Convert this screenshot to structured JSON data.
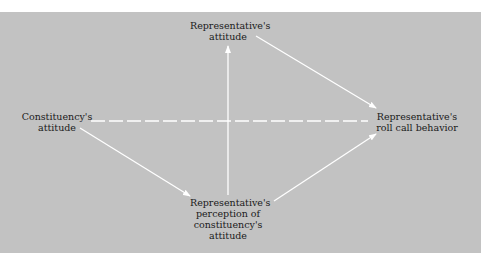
{
  "diagram": {
    "colors": {
      "background": "#c2c2c2",
      "arrow": "#ffffff",
      "text": "#1a1a1a",
      "page": "#ffffff"
    },
    "nodes": {
      "rep_attitude": {
        "lines": [
          "Representative's",
          "attitude"
        ]
      },
      "const_attitude": {
        "lines": [
          "Constituency's",
          "attitude"
        ]
      },
      "roll_call": {
        "lines": [
          "Representative's",
          "roll call behavior"
        ]
      },
      "perception": {
        "lines": [
          "Representative's",
          "perception of",
          "constituency's",
          "attitude"
        ]
      }
    },
    "edges": [
      {
        "from": "Constituency's attitude",
        "to": "Representative's perception of constituency's attitude",
        "style": "solid"
      },
      {
        "from": "Representative's perception of constituency's attitude",
        "to": "Representative's attitude",
        "style": "solid"
      },
      {
        "from": "Representative's perception of constituency's attitude",
        "to": "Representative's roll call behavior",
        "style": "solid"
      },
      {
        "from": "Representative's attitude",
        "to": "Representative's roll call behavior",
        "style": "solid"
      },
      {
        "from": "Constituency's attitude",
        "to": "Representative's roll call behavior",
        "style": "dashed"
      }
    ]
  }
}
